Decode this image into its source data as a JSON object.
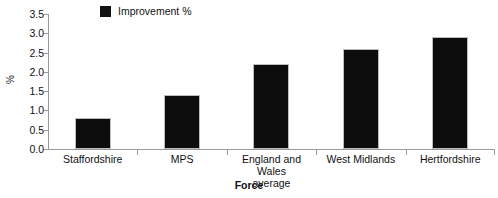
{
  "chart_data": {
    "type": "bar",
    "title": "",
    "subtitle": "",
    "xlabel": "Force",
    "ylabel": "%",
    "categories": [
      "Staffordshire",
      "England and Wales average",
      "MPS",
      "West Midlands",
      "Hertfordshire"
    ],
    "series": [
      {
        "name": "Improvement %",
        "values": [
          0.8,
          1.4,
          2.2,
          2.6,
          2.9
        ]
      }
    ],
    "category_order": [
      "Staffordshire",
      "MPS",
      "England and Wales average",
      "West Midlands",
      "Hertfordshire"
    ],
    "values": [
      0.8,
      1.4,
      2.2,
      2.6,
      2.9
    ],
    "ylim": [
      0.0,
      3.5
    ],
    "ytick_step": 0.5,
    "ytick_labels": [
      "0.0",
      "0.5",
      "1.0",
      "1.5",
      "2.0",
      "2.5",
      "3.0",
      "3.5"
    ],
    "ytick_values": [
      0.0,
      0.5,
      1.0,
      1.5,
      2.0,
      2.5,
      3.0,
      3.5
    ],
    "grid": false,
    "legend_position": "top-left",
    "bar_color": "#0d0d0d",
    "bar_edge_color": "#bdbdbd",
    "axis_color": "#9a9a9a",
    "background": "#ffffff"
  },
  "legend": {
    "entries": [
      {
        "label": "Improvement %",
        "color": "#111111",
        "marker": "square"
      }
    ]
  },
  "x_labels": [
    {
      "line1": "Staffordshire",
      "line2": ""
    },
    {
      "line1": "MPS",
      "line2": ""
    },
    {
      "line1": "England and Wales",
      "line2": "average"
    },
    {
      "line1": "West Midlands",
      "line2": ""
    },
    {
      "line1": "Hertfordshire",
      "line2": ""
    }
  ]
}
